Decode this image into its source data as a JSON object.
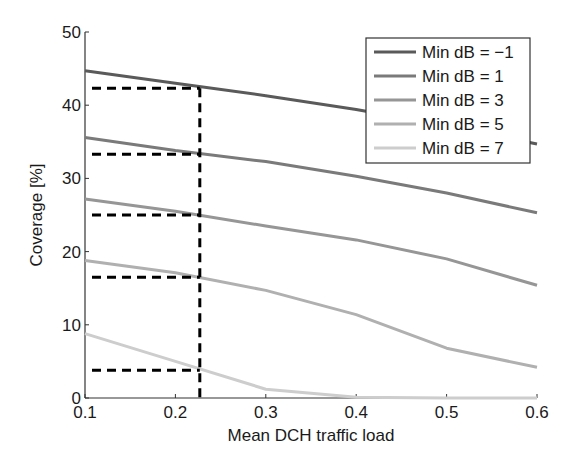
{
  "chart_data": {
    "type": "line",
    "title": "",
    "xlabel": "Mean DCH traffic load",
    "ylabel": "Coverage [%]",
    "xlim": [
      0.1,
      0.6
    ],
    "ylim": [
      0,
      50
    ],
    "xticks": [
      0.1,
      0.2,
      0.3,
      0.4,
      0.5,
      0.6
    ],
    "xtick_labels": [
      "0.1",
      "0.2",
      "0.3",
      "0.4",
      "0.5",
      "0.6"
    ],
    "yticks": [
      0,
      10,
      20,
      30,
      40,
      50
    ],
    "ytick_labels": [
      "0",
      "10",
      "20",
      "30",
      "40",
      "50"
    ],
    "grid": false,
    "legend_position": "upper right",
    "x": [
      0.1,
      0.2,
      0.3,
      0.4,
      0.5,
      0.6
    ],
    "series": [
      {
        "name": "Min dB = −1",
        "color": "#5a5a5a",
        "values": [
          44.7,
          43.0,
          41.3,
          39.4,
          37.2,
          34.7
        ]
      },
      {
        "name": "Min dB = 1",
        "color": "#7a7a7a",
        "values": [
          35.6,
          33.8,
          32.3,
          30.3,
          28.0,
          25.3
        ]
      },
      {
        "name": "Min dB = 3",
        "color": "#969696",
        "values": [
          27.2,
          25.5,
          23.5,
          21.6,
          19.0,
          15.4
        ]
      },
      {
        "name": "Min dB = 5",
        "color": "#b0b0b0",
        "values": [
          18.8,
          17.1,
          14.7,
          11.4,
          6.8,
          4.2
        ]
      },
      {
        "name": "Min dB = 7",
        "color": "#cdcdcd",
        "values": [
          8.8,
          5.0,
          1.2,
          0.1,
          0.0,
          0.0
        ]
      }
    ],
    "annotations": {
      "vertical_dashed_line_x": 0.227,
      "horizontal_dashed_lines_y": [
        42.3,
        33.3,
        25.0,
        16.5,
        3.8
      ],
      "style": "black dashed"
    }
  }
}
